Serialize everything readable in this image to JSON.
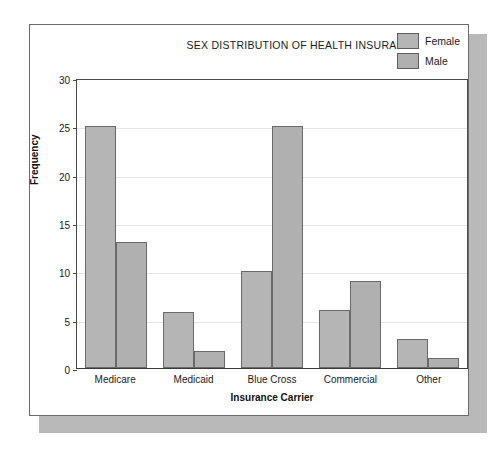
{
  "figure": {
    "frame_color": "#6d6d6d",
    "shadow_color": "#b9b9b9",
    "background": "#ffffff"
  },
  "legend": {
    "items": [
      {
        "label": "Female",
        "color": "#b5b5b5",
        "swatch_name": "legend-swatch-female"
      },
      {
        "label": "Male",
        "color": "#b0b0b0",
        "swatch_name": "legend-swatch-male"
      }
    ]
  },
  "chart_data": {
    "type": "bar",
    "title": "SEX DISTRIBUTION OF HEALTH INSURANCE",
    "xlabel": "Insurance Carrier",
    "ylabel": "Frequency",
    "categories": [
      "Medicare",
      "Medicaid",
      "Blue Cross",
      "Commercial",
      "Other"
    ],
    "series": [
      {
        "name": "Female",
        "color": "#b5b5b5",
        "values": [
          25,
          5.8,
          10,
          6,
          3
        ]
      },
      {
        "name": "Male",
        "color": "#b0b0b0",
        "values": [
          13,
          1.8,
          25,
          9,
          1
        ]
      }
    ],
    "ylim": [
      0,
      30
    ],
    "yticks": [
      0,
      5,
      10,
      15,
      20,
      25,
      30
    ],
    "ytick_labels": [
      "0",
      "5",
      "10",
      "15",
      "20",
      "25",
      "30"
    ],
    "grid": true,
    "grid_axis": "y",
    "legend_position": "top-right"
  }
}
